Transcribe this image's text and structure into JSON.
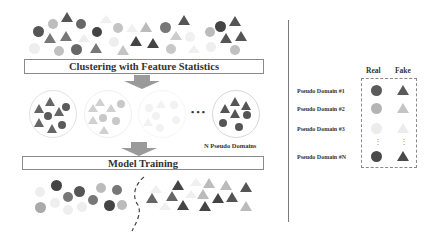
{
  "stages": {
    "clustering_label": "Clustering with Feature Statistics",
    "training_label": "Model Training"
  },
  "clusters": {
    "ellipsis": "• • •",
    "n_label": "N Pseudo Domains"
  },
  "legend": {
    "col_real": "Real",
    "col_fake": "Fake",
    "rows": [
      {
        "label": "Pseudo Domain #1",
        "color": "#5a5a5a"
      },
      {
        "label": "Pseudo Domain #2",
        "color": "#b4b4b4"
      },
      {
        "label": "Pseudo Domain #3",
        "color": "#ececec"
      },
      {
        "label": "Pseudo Domain #N",
        "color": "#4a4a4a"
      }
    ],
    "vdots": "⋮"
  },
  "colors": {
    "dark": "#555555",
    "mid": "#888888",
    "light": "#b8b8b8",
    "faint": "#e8e8e8",
    "arrow": "#9a9a9a"
  }
}
